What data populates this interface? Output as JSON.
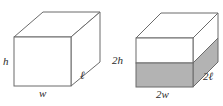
{
  "figure": {
    "background_color": "#ffffff",
    "edge_color": "#6b6b6b",
    "shade_color": "#b3b3b3",
    "label_color": "#2b2b2b",
    "shapes": [
      {
        "name": "original-box",
        "type": "rectangular-prism",
        "shaded": false,
        "labels": [
          "h",
          "w",
          "ℓ"
        ]
      },
      {
        "name": "scaled-box",
        "type": "rectangular-prism",
        "shaded": true,
        "shade_fraction": 0.5,
        "labels": [
          "2h",
          "2w",
          "2ℓ"
        ]
      }
    ]
  },
  "labels": {
    "left_height": "h",
    "left_width": "w",
    "left_length": "ℓ",
    "right_height": "2h",
    "right_width": "2w",
    "right_length": "2ℓ"
  }
}
